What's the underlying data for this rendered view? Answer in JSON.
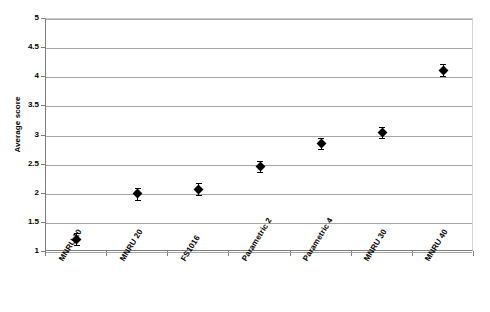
{
  "chart_data": {
    "type": "scatter",
    "title": "",
    "xlabel": "",
    "ylabel": "Average score",
    "ylim": [
      1,
      5
    ],
    "ytick_step": 0.5,
    "grid": true,
    "legend": "none",
    "error_bars": true,
    "categories": [
      "MNRU 10",
      "MNRU 20",
      "FS1016",
      "Parametric 2",
      "Parametric 4",
      "MNRU 30",
      "MNRU 40"
    ],
    "values": [
      1.22,
      2.0,
      2.08,
      2.47,
      2.86,
      3.05,
      4.12
    ],
    "errors": [
      0.1,
      0.1,
      0.1,
      0.1,
      0.09,
      0.1,
      0.1
    ],
    "ytick_labels": [
      "5",
      "4.5",
      "4",
      "3.5",
      "3",
      "2.5",
      "2",
      "1.5",
      "1"
    ],
    "ytick_values": [
      5,
      4.5,
      4,
      3.5,
      3,
      2.5,
      2,
      1.5,
      1
    ],
    "marker": "diamond",
    "marker_color": "#000000",
    "gridline_color": "#a6a6a6",
    "axis_color": "#7f7f7f",
    "background": "#ffffff"
  }
}
